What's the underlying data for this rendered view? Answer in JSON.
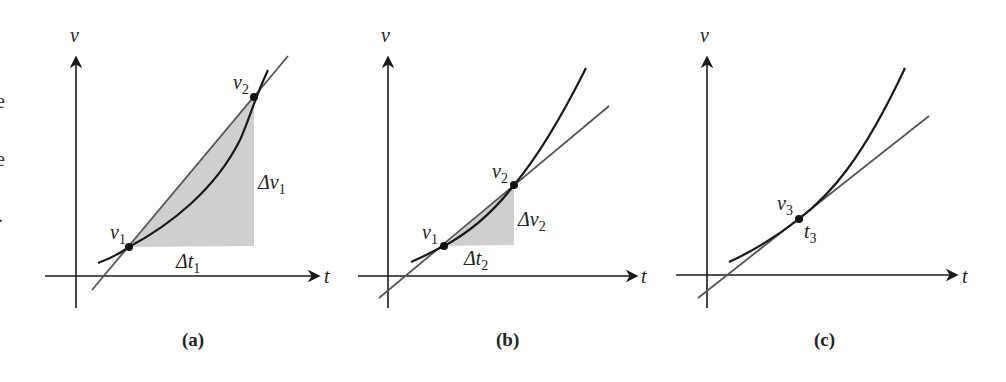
{
  "left_edge_fragments": [
    "e",
    "e",
    "."
  ],
  "colors": {
    "axis": "#1a1a1a",
    "curve": "#1a1a1a",
    "secant_line": "#555555",
    "shaded_triangle": "#cfcfcf",
    "point": "#111111"
  },
  "panels": [
    {
      "id": "a",
      "caption": "(a)",
      "axis_x_label": "t",
      "axis_y_label": "v",
      "line_type": "secant",
      "points": [
        {
          "label": "v",
          "sub": "1"
        },
        {
          "label": "v",
          "sub": "2"
        }
      ],
      "delta_t": {
        "label": "Δt",
        "sub": "1"
      },
      "delta_v": {
        "label": "Δv",
        "sub": "1"
      }
    },
    {
      "id": "b",
      "caption": "(b)",
      "axis_x_label": "t",
      "axis_y_label": "v",
      "line_type": "secant",
      "points": [
        {
          "label": "v",
          "sub": "1"
        },
        {
          "label": "v",
          "sub": "2"
        }
      ],
      "delta_t": {
        "label": "Δt",
        "sub": "2"
      },
      "delta_v": {
        "label": "Δv",
        "sub": "2"
      }
    },
    {
      "id": "c",
      "caption": "(c)",
      "axis_x_label": "t",
      "axis_y_label": "v",
      "line_type": "tangent",
      "points": [
        {
          "label": "v",
          "sub": "3"
        }
      ],
      "time_label": {
        "label": "t",
        "sub": "3"
      }
    }
  ]
}
